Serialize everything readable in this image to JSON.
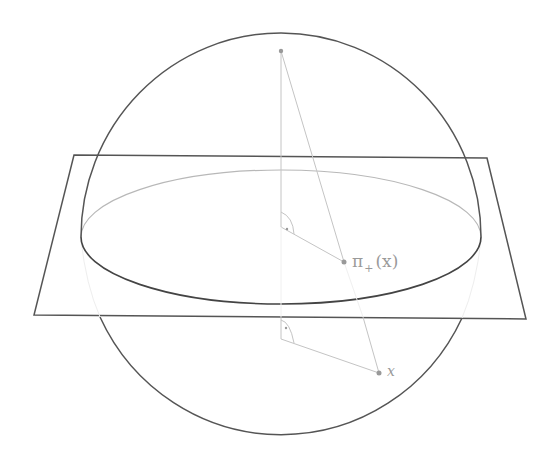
{
  "figure": {
    "labels": {
      "projection_symbol": "π",
      "projection_subscript": "+",
      "projection_arg": "(x)",
      "point_x": "x"
    },
    "colors": {
      "sphere_outline": "#555555",
      "plane_outline": "#555555",
      "equator_back": "#b8b8b8",
      "equator_front": "#444444",
      "construction_lines": "#c4c4c4",
      "points": "#999999",
      "label_text": "#9a9a9a"
    },
    "geometry": {
      "sphere_center": [
        281,
        236
      ],
      "sphere_radius": 202,
      "plane_corners": [
        [
          74,
          155
        ],
        [
          487,
          158
        ],
        [
          526,
          319
        ],
        [
          34,
          315
        ]
      ],
      "equator_ellipse": {
        "cx": 281,
        "cy": 237,
        "rx": 200,
        "ry": 67
      },
      "top_point": [
        281,
        51
      ],
      "projected_point": [
        344,
        262
      ],
      "point_x": [
        379,
        373
      ]
    }
  }
}
